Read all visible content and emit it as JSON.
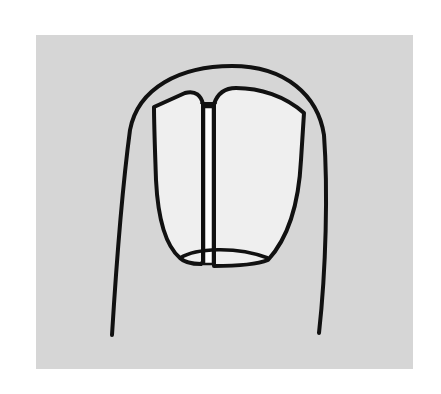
{
  "figure": {
    "background_color": "#ffffff",
    "panel_color": "#d6d6d6",
    "nail_fill_color": "#efefef",
    "groove_fill_color": "#ffffff",
    "stroke_color": "#111111",
    "parts": [
      {
        "name": "finger-outline",
        "label": "Finger outline"
      },
      {
        "name": "nail-plate-left",
        "label": "Left nail plate half"
      },
      {
        "name": "nail-plate-right",
        "label": "Right nail plate half"
      },
      {
        "name": "nail-split-groove",
        "label": "Longitudinal split"
      },
      {
        "name": "lunula",
        "label": "Lunula"
      }
    ]
  }
}
